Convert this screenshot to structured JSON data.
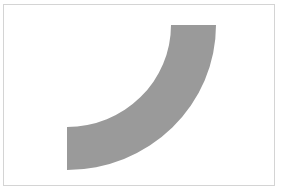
{
  "diagram": {
    "shape": "quarter-annulus",
    "fill_color": "#9a9a9a",
    "border_color": "#d4d4d4",
    "background_color": "#ffffff",
    "geometry": {
      "center": [
        67,
        25
      ],
      "inner_radius": 103,
      "outer_radius": 148,
      "start_angle_deg": 0,
      "end_angle_deg": 90
    }
  }
}
